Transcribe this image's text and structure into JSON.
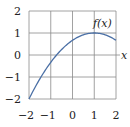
{
  "chart_data": {
    "type": "line",
    "title": "",
    "xlabel": "x",
    "ylabel": "",
    "xlim": [
      -2,
      2
    ],
    "ylim": [
      -2,
      2
    ],
    "grid": true,
    "legend": "none",
    "x_ticks": [
      -2,
      -1,
      0,
      1,
      2
    ],
    "y_ticks": [
      -2,
      -1,
      0,
      1,
      2
    ],
    "x_tick_labels": [
      "−2",
      "−1",
      "0",
      "1",
      "2"
    ],
    "y_tick_labels": [
      "−2",
      "−1",
      "0",
      "1",
      "2"
    ],
    "series": [
      {
        "name": "f(x)",
        "x": [
          -2,
          -1.5,
          -1,
          -0.5,
          0,
          0.5,
          1,
          1.5,
          2
        ],
        "values": [
          -2,
          -1.083,
          -0.333,
          0.25,
          0.667,
          0.917,
          1,
          0.917,
          0.667
        ],
        "color": "#4a6fa5"
      }
    ],
    "annotations": [
      {
        "text": "f(x)",
        "x": 1.7,
        "y": 1.3
      }
    ]
  },
  "labels": {
    "curve": "f(x)",
    "x_axis": "x"
  },
  "colors": {
    "curve": "#4a6fa5",
    "grid": "#8a8a8a",
    "text": "#222222"
  }
}
